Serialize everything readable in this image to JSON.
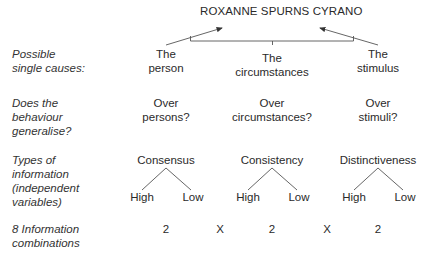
{
  "title": "ROXANNE SPURNS CYRANO",
  "rows": {
    "causes": {
      "label": [
        "Possible",
        "single causes:"
      ],
      "items": [
        {
          "l1": "The",
          "l2": "person"
        },
        {
          "l1": "The",
          "l2": "circumstances"
        },
        {
          "l1": "The",
          "l2": "stimulus"
        }
      ]
    },
    "generalise": {
      "label": [
        "Does the",
        "behaviour",
        "generalise?"
      ],
      "items": [
        {
          "l1": "Over",
          "l2": "persons?"
        },
        {
          "l1": "Over",
          "l2": "circumstances?"
        },
        {
          "l1": "Over",
          "l2": "stimuli?"
        }
      ]
    },
    "info": {
      "label": [
        "Types of",
        "information",
        "(independent",
        "variables)"
      ],
      "items": [
        {
          "name": "Consensus",
          "high": "High",
          "low": "Low"
        },
        {
          "name": "Consistency",
          "high": "High",
          "low": "Low"
        },
        {
          "name": "Distinctiveness",
          "high": "High",
          "low": "Low"
        }
      ]
    },
    "combinations": {
      "label": [
        "8 Information",
        "combinations"
      ],
      "values": [
        "2",
        "2",
        "2"
      ],
      "operator": "X"
    }
  }
}
